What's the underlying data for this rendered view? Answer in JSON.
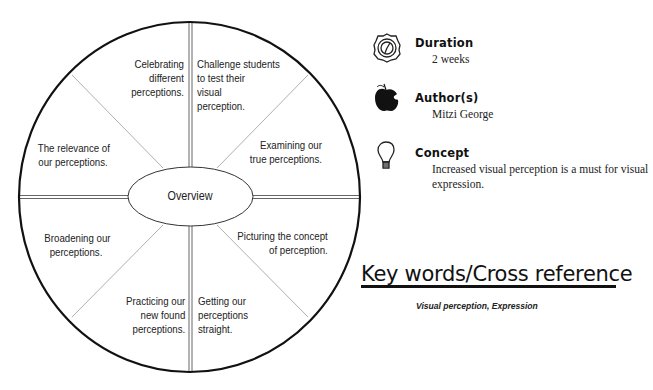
{
  "diagram": {
    "center_label": "Overview",
    "segments": [
      {
        "position": "top-left",
        "text": "Celebrating\ndifferent\nperceptions."
      },
      {
        "position": "top-right",
        "text": "Challenge students\nto test their\nvisual\nperception."
      },
      {
        "position": "right-upper",
        "text": "Examining our\ntrue perceptions."
      },
      {
        "position": "right-lower",
        "text": "Picturing the concept\nof perception."
      },
      {
        "position": "bottom-right",
        "text": "Getting our\nperceptions\nstraight."
      },
      {
        "position": "bottom-left",
        "text": "Practicing our\nnew found\nperceptions."
      },
      {
        "position": "left-lower",
        "text": "Broadening our\nperceptions."
      },
      {
        "position": "left-upper",
        "text": "The relevance of\nour perceptions."
      }
    ]
  },
  "info": {
    "duration": {
      "icon": "clock-icon",
      "title": "Duration",
      "value": "2 weeks"
    },
    "authors": {
      "icon": "apple-icon",
      "title": "Author(s)",
      "value": "Mitzi George"
    },
    "concept": {
      "icon": "lightbulb-icon",
      "title": "Concept",
      "value": "Increased visual perception is a must for visual expression."
    }
  },
  "keywords": {
    "heading": "Key words/Cross reference",
    "values": "Visual perception, Expression"
  },
  "colors": {
    "ink": "#111111",
    "line": "#888888"
  }
}
